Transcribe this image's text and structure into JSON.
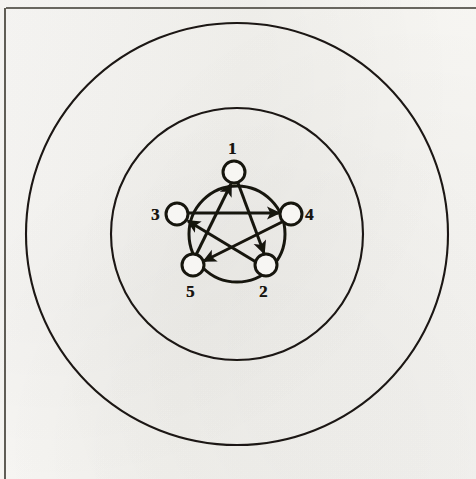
{
  "figure": {
    "kind": "scanned-diagram",
    "background_color": "#f7f6f3",
    "ink_color": "#17140f"
  },
  "page_frame": {
    "top_rule": {
      "name": "top-rule",
      "x1": 6,
      "y1": 8,
      "x2": 476,
      "y2": 8,
      "width": 1.6
    },
    "left_rule": {
      "name": "left-rule",
      "x1": 5,
      "y1": 8,
      "x2": 5,
      "y2": 479,
      "width": 1.6
    }
  },
  "circles": [
    {
      "name": "outer-circle",
      "cx": 237,
      "cy": 234,
      "r": 211,
      "stroke_width": 2.1
    },
    {
      "name": "middle-circle",
      "cx": 237,
      "cy": 234,
      "r": 126,
      "stroke_width": 2.1
    },
    {
      "name": "inner-circle",
      "cx": 237,
      "cy": 234,
      "r": 48,
      "stroke_width": 3.0
    }
  ],
  "nodes": [
    {
      "id": "1",
      "label": "1",
      "cx": 234,
      "cy": 172,
      "r": 11,
      "label_x": 228,
      "label_y": 140
    },
    {
      "id": "4",
      "label": "4",
      "cx": 291,
      "cy": 214,
      "r": 11,
      "label_x": 305,
      "label_y": 206
    },
    {
      "id": "2",
      "label": "2",
      "cx": 266,
      "cy": 265,
      "r": 11,
      "label_x": 259,
      "label_y": 283
    },
    {
      "id": "5",
      "label": "5",
      "cx": 193,
      "cy": 265,
      "r": 11,
      "label_x": 186,
      "label_y": 283
    },
    {
      "id": "3",
      "label": "3",
      "cx": 177,
      "cy": 214,
      "r": 11,
      "label_x": 151,
      "label_y": 206
    }
  ],
  "edges": [
    {
      "name": "edge-5-to-1",
      "from": "5",
      "to": "1",
      "directed": true
    },
    {
      "name": "edge-1-to-2",
      "from": "1",
      "to": "2",
      "directed": true
    },
    {
      "name": "edge-2-to-3",
      "from": "2",
      "to": "3",
      "directed": true
    },
    {
      "name": "edge-3-to-4",
      "from": "3",
      "to": "4",
      "directed": true
    },
    {
      "name": "edge-4-to-5",
      "from": "4",
      "to": "5",
      "directed": true
    }
  ],
  "node_order_clockwise": [
    "1",
    "4",
    "2",
    "5",
    "3"
  ],
  "labels_text": {
    "n1": "1",
    "n2": "2",
    "n3": "3",
    "n4": "4",
    "n5": "5"
  }
}
